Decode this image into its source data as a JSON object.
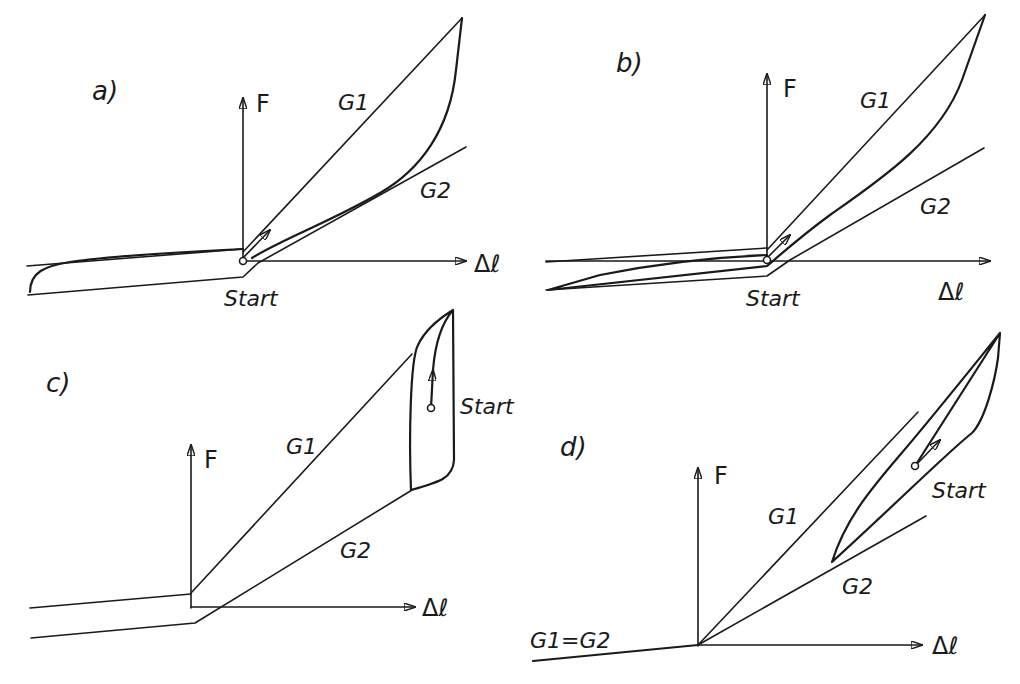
{
  "figure": {
    "panels": [
      {
        "id": "a",
        "label": "a)",
        "y_axis": "F",
        "x_axis": "Δℓ",
        "line_labels": [
          "G1",
          "G2"
        ],
        "start_label": "Start"
      },
      {
        "id": "b",
        "label": "b)",
        "y_axis": "F",
        "x_axis": "Δℓ",
        "line_labels": [
          "G1",
          "G2"
        ],
        "start_label": "Start"
      },
      {
        "id": "c",
        "label": "c)",
        "y_axis": "F",
        "x_axis": "Δℓ",
        "line_labels": [
          "G1",
          "G2"
        ],
        "start_label": "Start"
      },
      {
        "id": "d",
        "label": "d)",
        "y_axis": "F",
        "x_axis": "Δℓ",
        "line_labels": [
          "G1",
          "G2",
          "G1=G2"
        ],
        "start_label": "Start"
      }
    ]
  }
}
